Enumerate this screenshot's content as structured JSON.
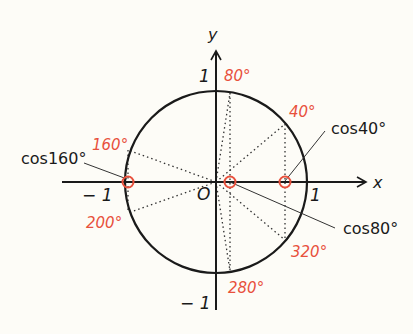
{
  "colors": {
    "background": "#fdfcf7",
    "ink": "#1a1a1a",
    "accent": "#e8503c"
  },
  "axes": {
    "x_label": "x",
    "y_label": "y",
    "origin_label": "O",
    "x_pos_tick": "1",
    "x_neg_tick": "− 1",
    "y_pos_tick": "1",
    "y_neg_tick": "− 1"
  },
  "angles": [
    {
      "label": "80°"
    },
    {
      "label": "40°"
    },
    {
      "label": "160°"
    },
    {
      "label": "200°"
    },
    {
      "label": "320°"
    },
    {
      "label": "280°"
    }
  ],
  "callouts": [
    {
      "label": "cos40°"
    },
    {
      "label": "cos160°"
    },
    {
      "label": "cos80°"
    }
  ]
}
